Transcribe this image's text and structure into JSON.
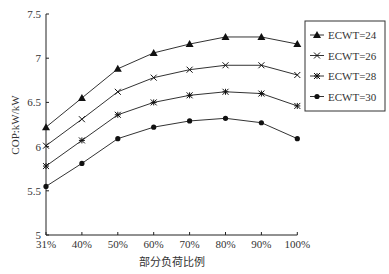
{
  "chart_data": {
    "type": "line",
    "title": "",
    "xlabel": "部分负荷比例",
    "ylabel": "COP:kW/kW",
    "categories": [
      "31%",
      "40%",
      "50%",
      "60%",
      "70%",
      "80%",
      "90%",
      "100%"
    ],
    "ylim": [
      5,
      7.5
    ],
    "yticks": [
      "5",
      "5.5",
      "6",
      "6.5",
      "7",
      "7.5"
    ],
    "grid": false,
    "legend_position": "right-top",
    "series": [
      {
        "name": "ECWT=24",
        "marker": "triangle",
        "values": [
          6.22,
          6.55,
          6.88,
          7.06,
          7.16,
          7.24,
          7.24,
          7.16
        ]
      },
      {
        "name": "ECWT=26",
        "marker": "x",
        "values": [
          6.01,
          6.31,
          6.62,
          6.78,
          6.87,
          6.92,
          6.92,
          6.81
        ]
      },
      {
        "name": "ECWT=28",
        "marker": "star",
        "values": [
          5.78,
          6.07,
          6.36,
          6.5,
          6.58,
          6.62,
          6.6,
          6.46
        ]
      },
      {
        "name": "ECWT=30",
        "marker": "circle",
        "values": [
          5.55,
          5.81,
          6.09,
          6.22,
          6.29,
          6.32,
          6.27,
          6.09
        ]
      }
    ]
  }
}
